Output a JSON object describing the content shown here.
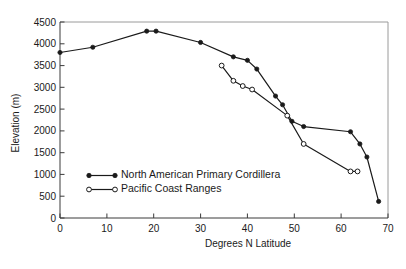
{
  "figure": {
    "background_color": "#ffffff",
    "ink_color": "#1a1a1a",
    "frame_color": "#9a9a9a"
  },
  "chart_data": {
    "type": "line",
    "title": "",
    "xlabel": "Degrees N Latitude",
    "ylabel": "Elevation (m)",
    "xlim": [
      0,
      70
    ],
    "ylim": [
      0,
      4500
    ],
    "xticks": [
      0,
      10,
      20,
      30,
      40,
      50,
      60,
      70
    ],
    "xticklabels": [
      "0",
      "10",
      "20",
      "30",
      "40",
      "50",
      "60",
      "70"
    ],
    "yticks": [
      0,
      500,
      1000,
      1500,
      2000,
      2500,
      3000,
      3500,
      4000,
      4500
    ],
    "yticklabels": [
      "0",
      "500",
      "1000",
      "1500",
      "2000",
      "2500",
      "3000",
      "3500",
      "4000",
      "4500"
    ],
    "grid": false,
    "legend_position": "lower-left-inside",
    "series": [
      {
        "name": "North American Primary Cordillera",
        "marker": "filled-circle",
        "marker_color": "#1a1a1a",
        "line_color": "#1a1a1a",
        "points": [
          [
            0,
            3800
          ],
          [
            7,
            3920
          ],
          [
            18.5,
            4290
          ],
          [
            20.5,
            4290
          ],
          [
            30,
            4030
          ],
          [
            37,
            3700
          ],
          [
            40,
            3620
          ],
          [
            42,
            3420
          ],
          [
            46,
            2800
          ],
          [
            47.5,
            2600
          ],
          [
            49.5,
            2220
          ],
          [
            52,
            2100
          ],
          [
            62,
            1980
          ],
          [
            64,
            1700
          ],
          [
            65.5,
            1400
          ],
          [
            68,
            380
          ]
        ]
      },
      {
        "name": "Pacific Coast Ranges",
        "marker": "open-circle",
        "marker_color": "#ffffff",
        "line_color": "#1a1a1a",
        "points": [
          [
            34.5,
            3500
          ],
          [
            37,
            3150
          ],
          [
            39,
            3030
          ],
          [
            41,
            2950
          ],
          [
            48.5,
            2350
          ],
          [
            52,
            1700
          ],
          [
            62,
            1070
          ],
          [
            63.5,
            1070
          ]
        ]
      }
    ]
  },
  "legend": {
    "entries": [
      {
        "label": "North American Primary Cordillera",
        "marker": "filled-circle"
      },
      {
        "label": "Pacific Coast Ranges",
        "marker": "open-circle"
      }
    ]
  },
  "caption": {
    "text": ""
  }
}
